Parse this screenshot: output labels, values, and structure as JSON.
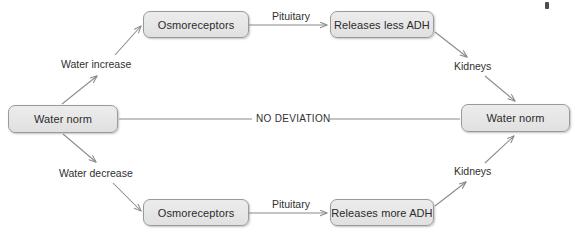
{
  "diagram": {
    "type": "flowchart",
    "colors": {
      "node_fill": "#e8e8e8",
      "node_border": "#9a9a9a",
      "connector": "#8a8a8a",
      "text": "#2b2b2b"
    },
    "nodes": [
      {
        "id": "water-norm-left",
        "label": "Water norm",
        "x": 8,
        "y": 105,
        "w": 110,
        "h": 28
      },
      {
        "id": "osmoreceptors-top",
        "label": "Osmoreceptors",
        "x": 143,
        "y": 11,
        "w": 106,
        "h": 27
      },
      {
        "id": "releases-less-adh",
        "label": "Releases less ADH",
        "x": 330,
        "y": 11,
        "w": 104,
        "h": 27
      },
      {
        "id": "water-norm-right",
        "label": "Water norm",
        "x": 461,
        "y": 104,
        "w": 109,
        "h": 28
      },
      {
        "id": "osmoreceptors-bottom",
        "label": "Osmoreceptors",
        "x": 143,
        "y": 199,
        "w": 106,
        "h": 27
      },
      {
        "id": "releases-more-adh",
        "label": "Releases more ADH",
        "x": 330,
        "y": 199,
        "w": 104,
        "h": 27
      }
    ],
    "edge_labels": [
      {
        "id": "water-increase",
        "label": "Water increase",
        "x": 61,
        "y": 58
      },
      {
        "id": "pituitary-top",
        "label": "Pituitary",
        "x": 272,
        "y": 10
      },
      {
        "id": "kidneys-top",
        "label": "Kidneys",
        "x": 454,
        "y": 60
      },
      {
        "id": "no-deviation",
        "label": "NO DEVIATION",
        "x": 256,
        "y": 113
      },
      {
        "id": "water-decrease",
        "label": "Water decrease",
        "x": 59,
        "y": 167
      },
      {
        "id": "pituitary-bottom",
        "label": "Pituitary",
        "x": 272,
        "y": 198
      },
      {
        "id": "kidneys-bottom",
        "label": "Kidneys",
        "x": 454,
        "y": 165
      }
    ],
    "connectors": [
      {
        "id": "norm-to-osmoreceptors-top",
        "from": "water-norm-left",
        "to": "osmoreceptors-top",
        "arrow": true
      },
      {
        "id": "osmoreceptors-top-to-less-adh",
        "from": "osmoreceptors-top",
        "to": "releases-less-adh",
        "arrow": true
      },
      {
        "id": "less-adh-to-kidneys-top",
        "from": "releases-less-adh",
        "to": "kidneys-top",
        "arrow": true
      },
      {
        "id": "kidneys-top-to-norm-right",
        "from": "kidneys-top",
        "to": "water-norm-right",
        "arrow": true
      },
      {
        "id": "norm-left-to-norm-right",
        "from": "water-norm-left",
        "to": "water-norm-right",
        "arrow": false
      },
      {
        "id": "norm-to-osmoreceptors-bottom",
        "from": "water-norm-left",
        "to": "osmoreceptors-bottom",
        "arrow": true
      },
      {
        "id": "osmoreceptors-bottom-to-more-adh",
        "from": "osmoreceptors-bottom",
        "to": "releases-more-adh",
        "arrow": true
      },
      {
        "id": "more-adh-to-kidneys-bottom",
        "from": "releases-more-adh",
        "to": "kidneys-bottom",
        "arrow": true
      },
      {
        "id": "kidneys-bottom-to-norm-right",
        "from": "kidneys-bottom",
        "to": "water-norm-right",
        "arrow": true
      }
    ]
  }
}
